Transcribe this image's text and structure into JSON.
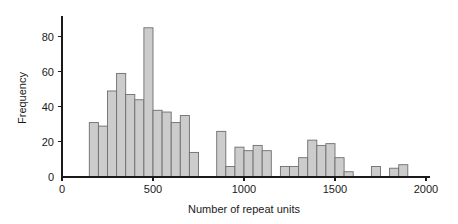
{
  "chart_data": {
    "type": "bar",
    "title": "",
    "subtitle": "",
    "xlabel": "Number of repeat units",
    "ylabel": "Frequency",
    "xlim": [
      0,
      2000
    ],
    "ylim": [
      0,
      90
    ],
    "grid": false,
    "legend": null,
    "bin_width": 50,
    "bar_fill": "#cccccc",
    "bar_stroke": "#6e6e6e",
    "axis_color": "#1a1a1a",
    "xticks": [
      0,
      500,
      1000,
      1500,
      2000
    ],
    "xtick_labels": [
      "0",
      "500",
      "1000",
      "1500",
      "2000"
    ],
    "yticks": [
      0,
      20,
      40,
      60,
      80
    ],
    "ytick_labels": [
      "0",
      "20",
      "40",
      "60",
      "80"
    ],
    "bin_starts": [
      150,
      200,
      250,
      300,
      350,
      400,
      450,
      500,
      550,
      600,
      650,
      700,
      750,
      850,
      900,
      950,
      1000,
      1050,
      1100,
      1150,
      1200,
      1250,
      1300,
      1350,
      1400,
      1450,
      1500,
      1550,
      1700,
      1800,
      1850
    ],
    "categories": [
      "150-200",
      "200-250",
      "250-300",
      "300-350",
      "350-400",
      "400-450",
      "450-500",
      "500-550",
      "550-600",
      "600-650",
      "650-700",
      "700-750",
      "750-800",
      "850-900",
      "900-950",
      "950-1000",
      "1000-1050",
      "1050-1100",
      "1100-1150",
      "1150-1200",
      "1200-1250",
      "1250-1300",
      "1300-1350",
      "1350-1400",
      "1400-1450",
      "1450-1500",
      "1500-1550",
      "1550-1600",
      "1700-1750",
      "1800-1850",
      "1850-1900"
    ],
    "values": [
      31,
      29,
      49,
      59,
      47,
      44,
      85,
      38,
      37,
      31,
      35,
      14,
      0,
      26,
      6,
      17,
      15,
      18,
      15,
      0,
      6,
      6,
      11,
      21,
      18,
      19,
      11,
      3,
      6,
      5,
      7
    ]
  }
}
